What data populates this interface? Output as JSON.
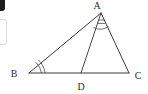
{
  "figure": {
    "background_color": "#ffffff",
    "line_color": "#3a3a3c",
    "label_color": "#2e2e30",
    "width": 148,
    "height": 94
  },
  "vertices": {
    "a": {
      "label": "A",
      "x": 101,
      "y": 13,
      "label_x": 97,
      "label_y": 9
    },
    "b": {
      "label": "B",
      "x": 29,
      "y": 73,
      "label_x": 14,
      "label_y": 77
    },
    "c": {
      "label": "C",
      "x": 129,
      "y": 73,
      "label_x": 134,
      "label_y": 79
    },
    "d": {
      "label": "D",
      "x": 81,
      "y": 73,
      "label_x": 77,
      "label_y": 90
    }
  },
  "segments": [
    {
      "name": "AB",
      "from": "A",
      "to": "B"
    },
    {
      "name": "AC",
      "from": "A",
      "to": "C"
    },
    {
      "name": "BC",
      "from": "B",
      "to": "C"
    },
    {
      "name": "AD",
      "from": "A",
      "to": "D"
    }
  ],
  "angle_marks": [
    {
      "name": "angle-BAD",
      "vertex": "A",
      "tick_count": 2,
      "description": "arc with two parallel ticks at vertex A"
    },
    {
      "name": "angle-B",
      "vertex": "B",
      "tick_count": 2,
      "description": "double arc at vertex B"
    }
  ],
  "artifacts": {
    "corner_mark": "cropped-dark-corner",
    "panel_edge": "cropped-panel-border"
  }
}
